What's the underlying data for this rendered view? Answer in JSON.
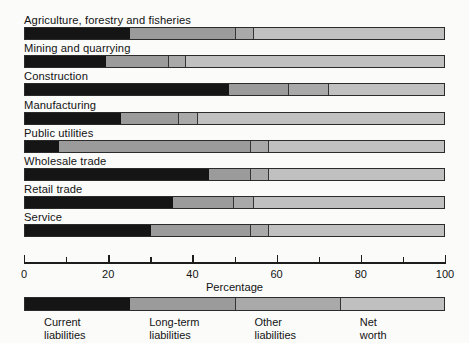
{
  "chart_data": {
    "type": "bar",
    "orientation": "horizontal",
    "stacked": true,
    "stack_total": 100,
    "title": "",
    "xlabel": "Percentage",
    "ylabel": "",
    "xlim": [
      0,
      100
    ],
    "xticks": [
      0,
      10,
      20,
      30,
      40,
      50,
      60,
      70,
      80,
      90,
      100
    ],
    "xtick_labels": [
      "0",
      "20",
      "40",
      "60",
      "80",
      "100"
    ],
    "xtick_label_values": [
      0,
      20,
      40,
      60,
      80,
      100
    ],
    "grid": false,
    "legend_position": "bottom",
    "categories": [
      "Agriculture, forestry and fisheries",
      "Mining and quarrying",
      "Construction",
      "Manufacturing",
      "Public utilities",
      "Wholesale trade",
      "Retail trade",
      "Service"
    ],
    "series": [
      {
        "name": "Current liabilities",
        "color": "#151515",
        "values": [
          25.0,
          19.3,
          48.5,
          22.8,
          8.1,
          43.7,
          35.2,
          29.9
        ]
      },
      {
        "name": "Long-term liabilities",
        "color": "#9b9b9b",
        "values": [
          25.0,
          14.9,
          14.2,
          13.8,
          45.6,
          10.0,
          14.5,
          23.8
        ]
      },
      {
        "name": "Other liabilities",
        "color": "#a9a9a9",
        "values": [
          4.5,
          4.0,
          9.5,
          4.5,
          4.3,
          4.3,
          4.8,
          4.3
        ]
      },
      {
        "name": "Net worth",
        "color": "#c0c0c0",
        "values": [
          45.5,
          61.8,
          27.8,
          58.9,
          42.0,
          42.0,
          45.5,
          42.0
        ]
      }
    ]
  },
  "axis": {
    "title": "Percentage",
    "tick_labels": [
      "0",
      "20",
      "40",
      "60",
      "80",
      "100"
    ]
  },
  "legend": {
    "items": [
      {
        "label": "Current\nliabilities",
        "color": "#151515"
      },
      {
        "label": "Long-term\nliabilities",
        "color": "#9b9b9b"
      },
      {
        "label": "Other\nliabilities",
        "color": "#a9a9a9"
      },
      {
        "label": "Net\nworth",
        "color": "#c0c0c0"
      }
    ]
  },
  "colors": {
    "current_liabilities": "#151515",
    "long_term_liabilities": "#9b9b9b",
    "other_liabilities": "#a9a9a9",
    "net_worth": "#c0c0c0",
    "outline": "#2b2b2b",
    "background": "#fbfbfa"
  }
}
